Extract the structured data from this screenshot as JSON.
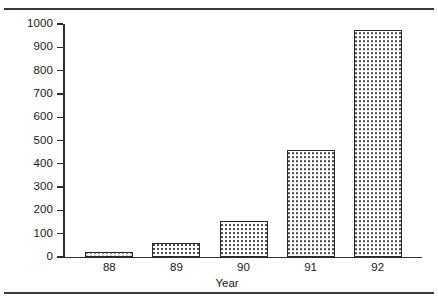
{
  "chart_data": {
    "type": "bar",
    "title": "",
    "xlabel": "Year",
    "ylabel": "",
    "categories": [
      "88",
      "89",
      "90",
      "91",
      "92"
    ],
    "values": [
      20,
      60,
      155,
      460,
      975
    ],
    "ylim": [
      0,
      1000
    ],
    "yticks": [
      0,
      100,
      200,
      300,
      400,
      500,
      600,
      700,
      800,
      900,
      1000
    ],
    "ytick_labels": [
      "0",
      "100",
      "200",
      "300",
      "400",
      "500",
      "600",
      "700",
      "800",
      "900",
      "1000"
    ],
    "grid": false,
    "legend": null,
    "bar_fill": "dotted-stipple",
    "bar_edge_color": "#2b2b2b",
    "bar_face_color": "#ffffff",
    "axis_color": "#2e2e2e",
    "rule_color": "#3a3a3a"
  },
  "figure": {
    "top_rule": "",
    "bottom_rule": ""
  }
}
